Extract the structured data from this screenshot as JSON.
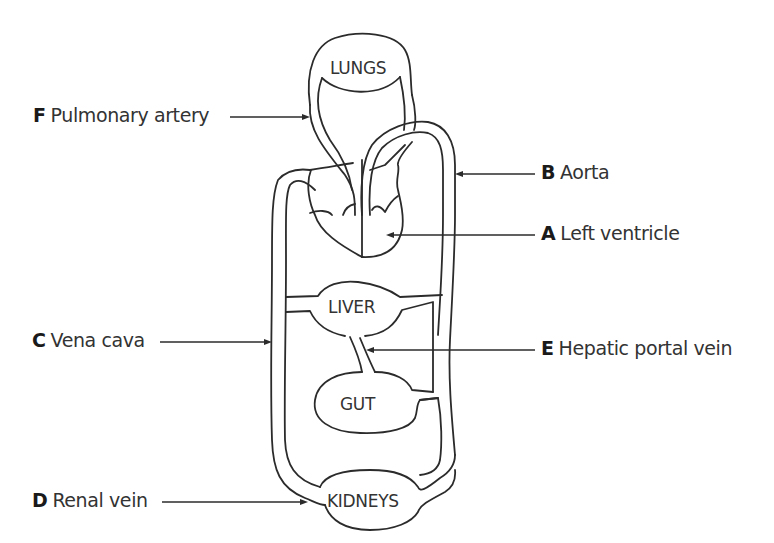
{
  "diagram": {
    "stroke_color": "#2b2b2b",
    "text_color": "#333333",
    "organs": {
      "lungs": "LUNGS",
      "liver": "LIVER",
      "gut": "GUT",
      "kidneys": "KIDNEYS"
    },
    "labels": [
      {
        "letter": "F",
        "text": "Pulmonary artery"
      },
      {
        "letter": "B",
        "text": "Aorta"
      },
      {
        "letter": "A",
        "text": "Left ventricle"
      },
      {
        "letter": "C",
        "text": "Vena cava"
      },
      {
        "letter": "E",
        "text": "Hepatic portal vein"
      },
      {
        "letter": "D",
        "text": "Renal vein"
      }
    ]
  }
}
